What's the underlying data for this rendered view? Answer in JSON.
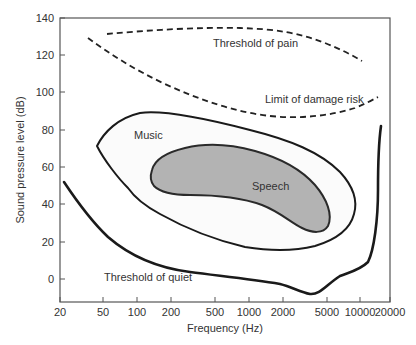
{
  "chart_data": {
    "type": "line",
    "title": "",
    "xlabel": "Frequency (Hz)",
    "ylabel": "Sound pressure level (dB)",
    "xscale": "log",
    "xlim": [
      20,
      20000
    ],
    "ylim": [
      -12,
      140
    ],
    "grid": false,
    "legend": "none (curves labeled inline)",
    "x_ticks": [
      "20",
      "50",
      "100",
      "200",
      "500",
      "1000",
      "2000",
      "5000",
      "10000",
      "20000"
    ],
    "y_ticks": [
      "0",
      "20",
      "40",
      "60",
      "80",
      "100",
      "120",
      "140"
    ],
    "series": [
      {
        "name": "Threshold of pain",
        "style": "dashed",
        "points": [
          [
            40,
            130
          ],
          [
            100,
            133
          ],
          [
            500,
            134
          ],
          [
            1000,
            134
          ],
          [
            2000,
            131
          ],
          [
            5000,
            124
          ],
          [
            10000,
            118
          ]
        ]
      },
      {
        "name": "Limit of damage risk",
        "style": "dashed",
        "points": [
          [
            35,
            128
          ],
          [
            50,
            119
          ],
          [
            100,
            107
          ],
          [
            200,
            97
          ],
          [
            500,
            88
          ],
          [
            1000,
            86
          ],
          [
            2000,
            86
          ],
          [
            5000,
            89
          ],
          [
            10000,
            92
          ],
          [
            17000,
            97
          ]
        ]
      },
      {
        "name": "Threshold of quiet",
        "style": "solid-thick",
        "points": [
          [
            22,
            66
          ],
          [
            30,
            51
          ],
          [
            50,
            38
          ],
          [
            100,
            22
          ],
          [
            200,
            11
          ],
          [
            500,
            5
          ],
          [
            1000,
            2
          ],
          [
            2000,
            -1
          ],
          [
            3500,
            -7
          ],
          [
            5000,
            -3
          ],
          [
            8000,
            2
          ],
          [
            12000,
            13
          ],
          [
            15000,
            42
          ],
          [
            16000,
            82
          ]
        ]
      }
    ],
    "regions": [
      {
        "name": "Music",
        "fill": "#fbfbfb",
        "outline_points": [
          [
            40,
            70
          ],
          [
            70,
            85
          ],
          [
            120,
            88
          ],
          [
            400,
            80
          ],
          [
            1500,
            70
          ],
          [
            3500,
            55
          ],
          [
            5500,
            40
          ],
          [
            5000,
            29
          ],
          [
            3000,
            23
          ],
          [
            1500,
            21
          ],
          [
            500,
            25
          ],
          [
            200,
            40
          ],
          [
            120,
            47
          ],
          [
            80,
            55
          ],
          [
            40,
            70
          ]
        ]
      },
      {
        "name": "Speech",
        "fill": "#b3b3b3",
        "outline_points": [
          [
            135,
            57
          ],
          [
            200,
            69
          ],
          [
            400,
            73
          ],
          [
            1000,
            69
          ],
          [
            2000,
            61
          ],
          [
            3500,
            53
          ],
          [
            5000,
            40
          ],
          [
            5200,
            29
          ],
          [
            4500,
            26
          ],
          [
            3500,
            29
          ],
          [
            2500,
            37
          ],
          [
            1200,
            42
          ],
          [
            500,
            45
          ],
          [
            200,
            45
          ],
          [
            140,
            49
          ],
          [
            135,
            57
          ]
        ]
      }
    ],
    "annotations": [
      "Threshold of pain",
      "Limit of damage risk",
      "Music",
      "Speech",
      "Threshold of quiet"
    ]
  },
  "axes": {
    "x_title": "Frequency (Hz)",
    "y_title": "Sound pressure level (dB)",
    "x_ticks": [
      {
        "label": "20",
        "x": 60
      },
      {
        "label": "50",
        "x": 103
      },
      {
        "label": "100",
        "x": 137
      },
      {
        "label": "200",
        "x": 171
      },
      {
        "label": "500",
        "x": 215
      },
      {
        "label": "1000",
        "x": 249
      },
      {
        "label": "2000",
        "x": 283
      },
      {
        "label": "5000",
        "x": 327
      },
      {
        "label": "10000",
        "x": 360
      },
      {
        "label": "20000",
        "x": 390
      }
    ],
    "y_ticks": [
      {
        "label": "140",
        "y": 18
      },
      {
        "label": "120",
        "y": 55
      },
      {
        "label": "100",
        "y": 92
      },
      {
        "label": "80",
        "y": 130
      },
      {
        "label": "60",
        "y": 167
      },
      {
        "label": "40",
        "y": 204
      },
      {
        "label": "20",
        "y": 242
      },
      {
        "label": "0",
        "y": 279
      }
    ]
  },
  "labels": {
    "pain": "Threshold of pain",
    "damage": "Limit of damage risk",
    "music": "Music",
    "speech": "Speech",
    "quiet": "Threshold of quiet"
  }
}
